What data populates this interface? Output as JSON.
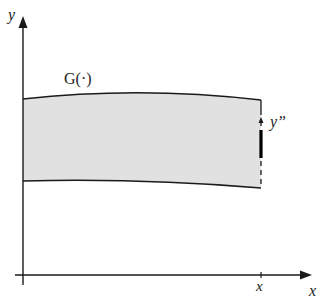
{
  "diagram": {
    "axes": {
      "y_label": "y",
      "x_label": "x",
      "x_tick_label": "x"
    },
    "curve_label": "G(·)",
    "marker_label": "y”",
    "colors": {
      "fill": "#e1e1e1",
      "line": "#1a1a1a",
      "background": "#ffffff"
    }
  }
}
